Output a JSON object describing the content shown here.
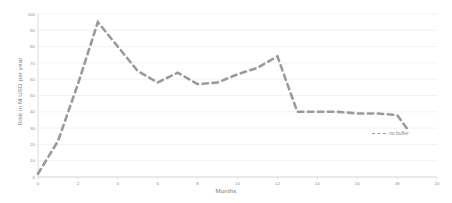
{
  "chart_data": {
    "type": "line",
    "title": "",
    "xlabel": "Months",
    "ylabel": "Risk in M USD per year",
    "xlim": [
      0,
      20
    ],
    "ylim": [
      0,
      100
    ],
    "xticks": [
      0,
      2,
      4,
      6,
      8,
      10,
      12,
      14,
      16,
      18,
      20
    ],
    "yticks": [
      0,
      10,
      20,
      30,
      40,
      50,
      60,
      70,
      80,
      90,
      100
    ],
    "grid": "horizontal",
    "legend_position": "inside-bottom-right",
    "series": [
      {
        "name": "no buffer",
        "style": "dashed",
        "color": "#9a9a9a",
        "x": [
          0,
          1,
          2,
          3,
          4,
          5,
          6,
          7,
          8,
          9,
          10,
          11,
          12,
          13,
          14,
          15,
          16,
          17,
          18,
          18.6
        ],
        "values": [
          2,
          22,
          57,
          95,
          80,
          65,
          58,
          64,
          57,
          58,
          63,
          67,
          74,
          40,
          40,
          40,
          39,
          39,
          38,
          28
        ]
      }
    ]
  },
  "axes": {
    "x_title": "Months",
    "y_title": "Risk in M USD per year",
    "x_tick_labels": [
      "0",
      "2",
      "4",
      "6",
      "8",
      "10",
      "12",
      "14",
      "16",
      "18",
      "20"
    ],
    "y_tick_labels": [
      "0",
      "10",
      "20",
      "30",
      "40",
      "50",
      "60",
      "70",
      "80",
      "90",
      "100"
    ]
  },
  "legend": {
    "entries": [
      {
        "label": "no buffer"
      }
    ]
  },
  "colors": {
    "series": "#9a9a9a",
    "grid": "#ececec",
    "axis": "#d4d4d4",
    "text": "#8d8d8d"
  }
}
